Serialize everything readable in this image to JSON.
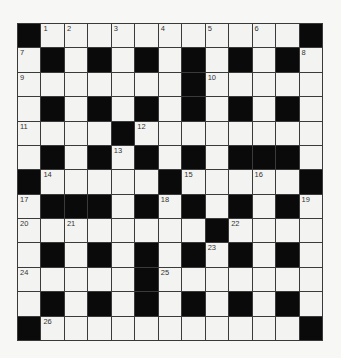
{
  "puzzle": {
    "type": "crossword",
    "rows": 13,
    "cols": 13,
    "legend": {
      "#": "black-square",
      ".": "empty-square",
      "number": "numbered-empty-square"
    },
    "colors": {
      "block": "#0a0a0a",
      "cell": "#f3f3f1",
      "line": "#3a3a3a",
      "number": "#333333"
    },
    "grid": [
      [
        "#",
        "1",
        "2",
        ".",
        "3",
        ".",
        "4",
        ".",
        "5",
        ".",
        "6",
        ".",
        "#"
      ],
      [
        "7",
        "#",
        ".",
        "#",
        ".",
        "#",
        ".",
        "#",
        ".",
        "#",
        ".",
        "#",
        "8"
      ],
      [
        "9",
        ".",
        ".",
        ".",
        ".",
        ".",
        ".",
        "#",
        "10",
        ".",
        ".",
        ".",
        "."
      ],
      [
        ".",
        "#",
        ".",
        "#",
        ".",
        "#",
        ".",
        "#",
        ".",
        "#",
        ".",
        "#",
        "."
      ],
      [
        "11",
        ".",
        ".",
        ".",
        "#",
        "12",
        ".",
        ".",
        ".",
        ".",
        ".",
        ".",
        "."
      ],
      [
        ".",
        "#",
        ".",
        "#",
        "13",
        "#",
        ".",
        "#",
        ".",
        "#",
        "#",
        "#",
        "."
      ],
      [
        "#",
        "14",
        ".",
        ".",
        ".",
        ".",
        "#",
        "15",
        ".",
        ".",
        "16",
        ".",
        "#"
      ],
      [
        "17",
        "#",
        "#",
        "#",
        ".",
        "#",
        "18",
        "#",
        ".",
        "#",
        ".",
        "#",
        "19"
      ],
      [
        "20",
        ".",
        "21",
        ".",
        ".",
        ".",
        ".",
        ".",
        "#",
        "22",
        ".",
        ".",
        "."
      ],
      [
        ".",
        "#",
        ".",
        "#",
        ".",
        "#",
        ".",
        "#",
        "23",
        "#",
        ".",
        "#",
        "."
      ],
      [
        "24",
        ".",
        ".",
        ".",
        ".",
        "#",
        "25",
        ".",
        ".",
        ".",
        ".",
        ".",
        "."
      ],
      [
        ".",
        "#",
        ".",
        "#",
        ".",
        "#",
        ".",
        "#",
        ".",
        "#",
        ".",
        "#",
        "."
      ],
      [
        "#",
        "26",
        ".",
        ".",
        ".",
        ".",
        ".",
        ".",
        ".",
        ".",
        ".",
        ".",
        "#"
      ]
    ],
    "clue_numbers": [
      "1",
      "2",
      "3",
      "4",
      "5",
      "6",
      "7",
      "8",
      "9",
      "10",
      "11",
      "12",
      "13",
      "14",
      "15",
      "16",
      "17",
      "18",
      "19",
      "20",
      "21",
      "22",
      "23",
      "24",
      "25",
      "26"
    ]
  }
}
